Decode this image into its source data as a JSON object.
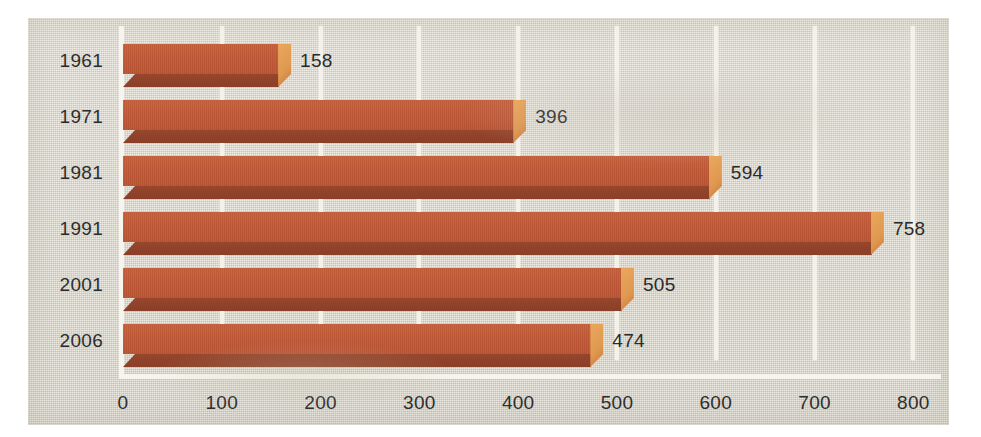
{
  "chart_data": {
    "type": "bar",
    "orientation": "horizontal",
    "style": "3d-printed-scan",
    "title": "",
    "subtitle": "",
    "xlabel": "",
    "ylabel": "",
    "categories": [
      "1961",
      "1971",
      "1981",
      "1991",
      "2001",
      "2006"
    ],
    "values": [
      158,
      396,
      594,
      758,
      505,
      474
    ],
    "value_labels": [
      "158",
      "396",
      "594",
      "758",
      "505",
      "474"
    ],
    "xlim": [
      0,
      800
    ],
    "xticks": [
      0,
      100,
      200,
      300,
      400,
      500,
      600,
      700,
      800
    ],
    "xtick_labels": [
      "0",
      "100",
      "200",
      "300",
      "400",
      "500",
      "600",
      "700",
      "800"
    ],
    "grid": "vertical-only",
    "gridline_color": "#f3f1e8",
    "legend": null,
    "series": [
      {
        "name": "",
        "values": [
          158,
          396,
          594,
          758,
          505,
          474
        ]
      }
    ],
    "bar_color_top": "#c25a38",
    "bar_color_shadow": "#8d4129",
    "bar_color_cap": "#e09b52",
    "background_color": "#d9d5c4",
    "text_color": "#2e2e2e"
  }
}
